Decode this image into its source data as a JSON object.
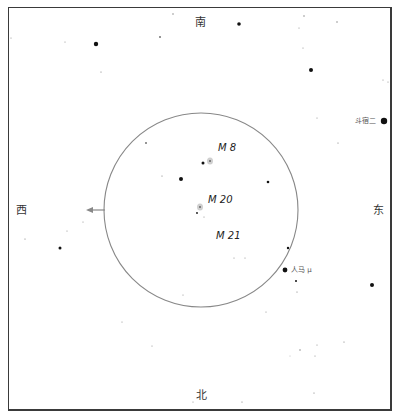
{
  "directions": {
    "south": "南",
    "north": "北",
    "west": "西",
    "east": "东"
  },
  "objects": [
    {
      "id": "m8",
      "label": "M 8",
      "x": 218,
      "y": 143
    },
    {
      "id": "m20",
      "label": "M 20",
      "x": 208,
      "y": 195
    },
    {
      "id": "m21",
      "label": "M 21",
      "x": 216,
      "y": 231
    }
  ],
  "named_stars": [
    {
      "id": "kaus-borealis",
      "label": "斗宿二",
      "x": 384,
      "y": 121,
      "r": 3.2
    },
    {
      "id": "mu-sgr",
      "label": "人马 μ",
      "x": 285,
      "y": 270,
      "r": 2.4
    }
  ],
  "field_of_view": {
    "cx": 201,
    "cy": 210,
    "r": 97,
    "stroke": "#888888"
  },
  "arrow": {
    "x1": 105,
    "y1": 210,
    "x2": 86,
    "y2": 210,
    "color": "#888888"
  },
  "nebulae": [
    {
      "id": "m8-nebula",
      "x": 210,
      "y": 161
    },
    {
      "id": "m20-nebula",
      "x": 200,
      "y": 207
    }
  ],
  "stars": [
    {
      "x": 96,
      "y": 44,
      "r": 2.2
    },
    {
      "x": 239,
      "y": 24,
      "r": 1.8
    },
    {
      "x": 311,
      "y": 70,
      "r": 2.0
    },
    {
      "x": 181,
      "y": 179,
      "r": 2.0
    },
    {
      "x": 203,
      "y": 163,
      "r": 1.5
    },
    {
      "x": 268,
      "y": 182,
      "r": 1.3
    },
    {
      "x": 60,
      "y": 248,
      "r": 1.5
    },
    {
      "x": 372,
      "y": 285,
      "r": 2.0
    },
    {
      "x": 288,
      "y": 248,
      "r": 1.2
    },
    {
      "x": 296,
      "y": 281,
      "r": 1.0
    },
    {
      "x": 197,
      "y": 213,
      "r": 0.9
    },
    {
      "x": 146,
      "y": 143,
      "r": 0.8
    },
    {
      "x": 173,
      "y": 14,
      "r": 0.7
    },
    {
      "x": 160,
      "y": 37,
      "r": 0.8
    },
    {
      "x": 304,
      "y": 16,
      "r": 0.7
    },
    {
      "x": 337,
      "y": 22,
      "r": 0.7
    },
    {
      "x": 101,
      "y": 72,
      "r": 0.6
    },
    {
      "x": 65,
      "y": 42,
      "r": 0.5
    },
    {
      "x": 25,
      "y": 239,
      "r": 0.6
    },
    {
      "x": 11,
      "y": 38,
      "r": 0.5
    },
    {
      "x": 303,
      "y": 48,
      "r": 0.5
    },
    {
      "x": 299,
      "y": 28,
      "r": 0.5
    },
    {
      "x": 383,
      "y": 80,
      "r": 0.5
    },
    {
      "x": 388,
      "y": 82,
      "r": 0.5
    },
    {
      "x": 338,
      "y": 143,
      "r": 0.6
    },
    {
      "x": 317,
      "y": 118,
      "r": 0.5
    },
    {
      "x": 162,
      "y": 176,
      "r": 0.6
    },
    {
      "x": 67,
      "y": 231,
      "r": 0.5
    },
    {
      "x": 83,
      "y": 222,
      "r": 0.5
    },
    {
      "x": 234,
      "y": 258,
      "r": 0.5
    },
    {
      "x": 245,
      "y": 258,
      "r": 0.5
    },
    {
      "x": 183,
      "y": 295,
      "r": 0.5
    },
    {
      "x": 297,
      "y": 292,
      "r": 0.6
    },
    {
      "x": 266,
      "y": 312,
      "r": 0.5
    },
    {
      "x": 122,
      "y": 322,
      "r": 0.5
    },
    {
      "x": 152,
      "y": 346,
      "r": 0.5
    },
    {
      "x": 300,
      "y": 350,
      "r": 0.7
    },
    {
      "x": 317,
      "y": 345,
      "r": 0.5
    },
    {
      "x": 315,
      "y": 356,
      "r": 0.5
    },
    {
      "x": 344,
      "y": 342,
      "r": 0.6
    },
    {
      "x": 314,
      "y": 393,
      "r": 0.6
    },
    {
      "x": 242,
      "y": 402,
      "r": 0.6
    },
    {
      "x": 193,
      "y": 402,
      "r": 0.5
    },
    {
      "x": 204,
      "y": 217,
      "r": 0.5
    },
    {
      "x": 290,
      "y": 356,
      "r": 0.4
    }
  ]
}
